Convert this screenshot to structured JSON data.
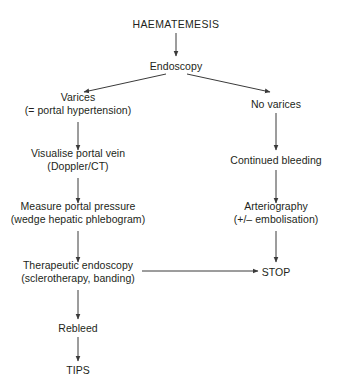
{
  "diagram": {
    "title_text": "HAEMATEMESIS",
    "type": "flowchart",
    "background_color": "#ffffff",
    "text_color": "#231f20",
    "line_color": "#3a3a3a",
    "nodes": [
      {
        "id": "haematemesis",
        "label": "HAEMATEMESIS",
        "label2": "",
        "x": 176,
        "y": 24
      },
      {
        "id": "endoscopy",
        "label": "Endoscopy",
        "label2": "",
        "x": 176,
        "y": 66
      },
      {
        "id": "varices",
        "label": "Varices",
        "label2": "(= portal hypertension)",
        "x": 78,
        "y": 104
      },
      {
        "id": "no-varices",
        "label": "No varices",
        "label2": "",
        "x": 276,
        "y": 104
      },
      {
        "id": "visualise",
        "label": "Visualise portal vein",
        "label2": "(Doppler/CT)",
        "x": 78,
        "y": 160
      },
      {
        "id": "continued",
        "label": "Continued bleeding",
        "label2": "",
        "x": 276,
        "y": 160
      },
      {
        "id": "measure",
        "label": "Measure portal pressure",
        "label2": "(wedge hepatic phlebogram)",
        "x": 78,
        "y": 213
      },
      {
        "id": "arteriography",
        "label": "Arteriography",
        "label2": "(+/– embolisation)",
        "x": 276,
        "y": 213
      },
      {
        "id": "therapeutic",
        "label": "Therapeutic endoscopy",
        "label2": "(sclerotherapy, banding)",
        "x": 78,
        "y": 272
      },
      {
        "id": "stop",
        "label": "STOP",
        "label2": "",
        "x": 276,
        "y": 272
      },
      {
        "id": "rebleed",
        "label": "Rebleed",
        "label2": "",
        "x": 78,
        "y": 328
      },
      {
        "id": "tips",
        "label": "TIPS",
        "label2": "",
        "x": 78,
        "y": 370
      }
    ],
    "edges": [
      {
        "from": "haematemesis",
        "to": "endoscopy",
        "kind": "vertical"
      },
      {
        "from": "endoscopy",
        "to": "varices",
        "kind": "diagonal-left"
      },
      {
        "from": "endoscopy",
        "to": "no-varices",
        "kind": "diagonal-right"
      },
      {
        "from": "varices",
        "to": "visualise",
        "kind": "vertical"
      },
      {
        "from": "no-varices",
        "to": "continued",
        "kind": "vertical"
      },
      {
        "from": "visualise",
        "to": "measure",
        "kind": "vertical"
      },
      {
        "from": "continued",
        "to": "arteriography",
        "kind": "vertical"
      },
      {
        "from": "measure",
        "to": "therapeutic",
        "kind": "vertical"
      },
      {
        "from": "arteriography",
        "to": "stop",
        "kind": "vertical"
      },
      {
        "from": "therapeutic",
        "to": "stop",
        "kind": "horizontal"
      },
      {
        "from": "therapeutic",
        "to": "rebleed",
        "kind": "vertical"
      },
      {
        "from": "rebleed",
        "to": "tips",
        "kind": "vertical"
      }
    ]
  }
}
